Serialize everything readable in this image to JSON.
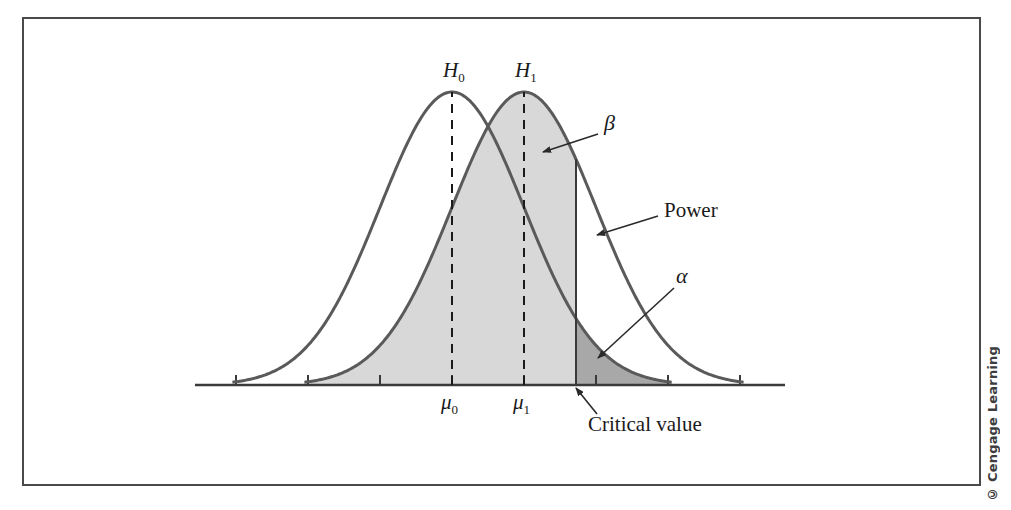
{
  "figure": {
    "credit": "© Cengage Learning",
    "frame_color": "#4a4a4a",
    "background": "#ffffff"
  },
  "labels": {
    "h0": "H",
    "h0_sub": "0",
    "h1": "H",
    "h1_sub": "1",
    "mu0": "μ",
    "mu0_sub": "0",
    "mu1": "μ",
    "mu1_sub": "1",
    "beta": "β",
    "alpha": "α",
    "power": "Power",
    "critical_value": "Critical value"
  },
  "chart_data": {
    "type": "line",
    "title": "",
    "xlabel": "",
    "ylabel": "",
    "grid": false,
    "legend_position": "none",
    "axis": {
      "x_start_px": 195,
      "x_end_px": 785,
      "baseline_y_px": 385,
      "tick_positions_px": [
        236,
        308,
        380,
        452,
        524,
        596,
        668,
        740
      ],
      "tick_length_px": 10
    },
    "curves": [
      {
        "name": "H0 null distribution",
        "mean_px": 452,
        "sigma_px": 72,
        "peak_y_px": 92,
        "stroke": "#5a5a5a",
        "stroke_width": 3,
        "fill": "none"
      },
      {
        "name": "H1 alternative distribution",
        "mean_px": 524,
        "sigma_px": 72,
        "peak_y_px": 92,
        "stroke": "#5a5a5a",
        "stroke_width": 3,
        "fill": "#d8d8d8"
      }
    ],
    "critical_value": {
      "x_px": 576,
      "label": "Critical value"
    },
    "regions": [
      {
        "name": "beta",
        "label": "β",
        "description": "Type II error region: area under H1 curve left of critical value",
        "color": "#d8d8d8"
      },
      {
        "name": "alpha",
        "label": "α",
        "description": "Type I error region: area under H0 curve right of critical value",
        "color": "#a8a8a8"
      },
      {
        "name": "power",
        "label": "Power",
        "description": "Area under H1 curve right of critical value",
        "color": "#ffffff"
      }
    ],
    "annotations": [
      {
        "label": "β",
        "text_px": [
          606,
          125
        ],
        "arrow_from_px": [
          598,
          134
        ],
        "arrow_to_px": [
          543,
          152
        ]
      },
      {
        "label": "Power",
        "text_px": [
          666,
          212
        ],
        "arrow_from_px": [
          658,
          216
        ],
        "arrow_to_px": [
          597,
          235
        ]
      },
      {
        "label": "α",
        "text_px": [
          680,
          277
        ],
        "arrow_from_px": [
          674,
          288
        ],
        "arrow_to_px": [
          598,
          358
        ]
      },
      {
        "label": "Critical value",
        "text_px": [
          590,
          424
        ],
        "arrow_from_px": [
          597,
          414
        ],
        "arrow_to_px": [
          576,
          388
        ]
      }
    ]
  }
}
